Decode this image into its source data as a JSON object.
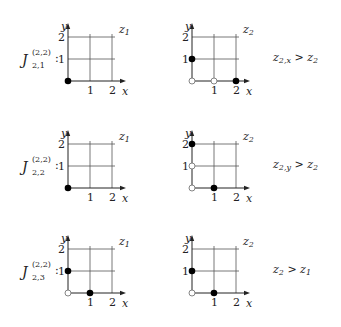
{
  "rows": [
    {
      "label": {
        "base": "J",
        "sup": "(2,2)",
        "sub": "2,1"
      },
      "left": {
        "name": "z",
        "idx": "1",
        "filled": [
          [
            0,
            0
          ]
        ],
        "open": []
      },
      "right": {
        "name": "z",
        "idx": "2",
        "filled": [
          [
            0,
            1
          ],
          [
            2,
            0
          ]
        ],
        "open": [
          [
            0,
            0
          ],
          [
            1,
            0
          ]
        ]
      },
      "relation": {
        "lhs": "z",
        "lhs_sub": "2,x",
        "op": ">",
        "rhs": "z",
        "rhs_sub": "2"
      }
    },
    {
      "label": {
        "base": "J",
        "sup": "(2,2)",
        "sub": "2,2"
      },
      "left": {
        "name": "z",
        "idx": "1",
        "filled": [
          [
            0,
            0
          ]
        ],
        "open": []
      },
      "right": {
        "name": "z",
        "idx": "2",
        "filled": [
          [
            0,
            2
          ],
          [
            1,
            0
          ]
        ],
        "open": [
          [
            0,
            0
          ],
          [
            0,
            1
          ]
        ]
      },
      "relation": {
        "lhs": "z",
        "lhs_sub": "2,y",
        "op": ">",
        "rhs": "z",
        "rhs_sub": "2"
      }
    },
    {
      "label": {
        "base": "J",
        "sup": "(2,2)",
        "sub": "2,3"
      },
      "left": {
        "name": "z",
        "idx": "1",
        "filled": [
          [
            0,
            1
          ],
          [
            1,
            0
          ]
        ],
        "open": [
          [
            0,
            0
          ]
        ]
      },
      "right": {
        "name": "z",
        "idx": "2",
        "filled": [
          [
            0,
            1
          ],
          [
            1,
            0
          ]
        ],
        "open": [
          [
            0,
            0
          ]
        ]
      },
      "relation": {
        "lhs": "z",
        "lhs_sub": "2",
        "op": ">",
        "rhs": "z",
        "rhs_sub": "1"
      }
    }
  ],
  "axes": {
    "x_label": "x",
    "y_label": "y",
    "ticks": [
      "1",
      "2"
    ]
  }
}
